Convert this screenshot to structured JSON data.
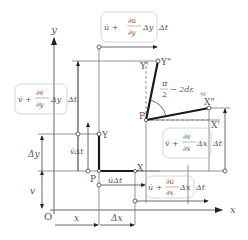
{
  "diagram": {
    "axes": {
      "x_label": "x",
      "y_label": "y",
      "origin_label": "O"
    },
    "points": {
      "P": "P",
      "X": "X",
      "Y": "Y",
      "P_prime": "P'",
      "X_prime": "X'",
      "Y_prime": "Y'",
      "X_double_prime": "X\"",
      "Y_double_prime": "Y\""
    },
    "dimensions": {
      "x": "x",
      "dx": "Δx",
      "v": "v",
      "dy": "Δy"
    },
    "displacements": {
      "u_dt": "u̇Δt",
      "v_dt": "v̇Δt",
      "u_top": {
        "prefix": "u̇ +",
        "num": "∂u̇",
        "den": "∂y",
        "suffix": "Δy",
        "tail": "Δt"
      },
      "v_left": {
        "prefix": "v̇ +",
        "num": "∂v̇",
        "den": "∂y",
        "suffix": "Δy",
        "tail": "Δt"
      },
      "v_right": {
        "prefix": "v̇ +",
        "num": "∂v̇",
        "den": "∂x",
        "suffix": "Δx",
        "tail": "Δt"
      },
      "u_bottom": {
        "prefix": "u̇ +",
        "num": "∂u̇",
        "den": "∂x",
        "suffix": "Δx",
        "tail": "Δt"
      }
    },
    "angle": {
      "num": "π",
      "den": "2",
      "suffix": "− 2dε",
      "sub": "xy"
    },
    "colors": {
      "line": "#666666",
      "thick": "#1a1a1a",
      "text": "#555555"
    }
  }
}
